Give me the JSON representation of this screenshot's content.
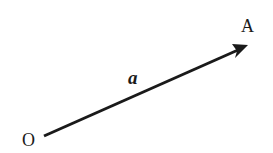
{
  "diagram": {
    "type": "vector",
    "origin_label": "O",
    "endpoint_label": "A",
    "vector_label": "a",
    "stroke_color": "#1a1a1a"
  }
}
